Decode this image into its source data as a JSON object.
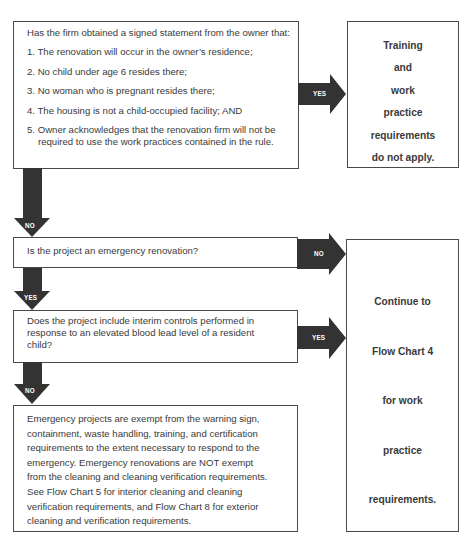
{
  "flowchart": {
    "box1": {
      "intro": "Has the firm obtained a signed statement from the owner that:",
      "items": [
        "1. The renovation will occur in the owner’s residence;",
        "2. No child under age 6 resides there;",
        "3. No woman who is pregnant resides there;",
        "4. The housing is not a child-occupied facility; AND",
        "5. Owner acknowledges that the renovation firm will not be"
      ],
      "item5_cont": "required to use the work practices contained in the rule."
    },
    "result1": {
      "lines": [
        "Training",
        "and",
        "work",
        "practice",
        "requirements",
        "do not apply."
      ]
    },
    "box2": {
      "text": "Is the project an emergency renovation?"
    },
    "box3": {
      "lines": [
        "Does the project include interim controls performed in",
        "response to an elevated blood lead level of a resident",
        "child?"
      ]
    },
    "box4": {
      "lines": [
        "Emergency projects are exempt from the warning sign,",
        "containment, waste handling, training, and certification",
        "requirements to the extent necessary to respond to the",
        "emergency. Emergency renovations are NOT exempt",
        "from the cleaning and cleaning verification requirements.",
        "See Flow Chart 5 for interior cleaning and cleaning",
        "verification requirements, and Flow Chart 8 for exterior",
        "cleaning and verification requirements."
      ]
    },
    "result2": {
      "lines": [
        "Continue to",
        "Flow Chart 4",
        "for work",
        "practice",
        "requirements."
      ]
    },
    "arrows": {
      "a1_yes": "YES",
      "a2_no": "NO",
      "a3_no": "NO",
      "a4_yes": "YES",
      "a5_yes": "YES",
      "a6_no": "NO"
    },
    "colors": {
      "arrow": "#333333",
      "border": "#4a4a4a",
      "text": "#3a3a3a"
    }
  }
}
